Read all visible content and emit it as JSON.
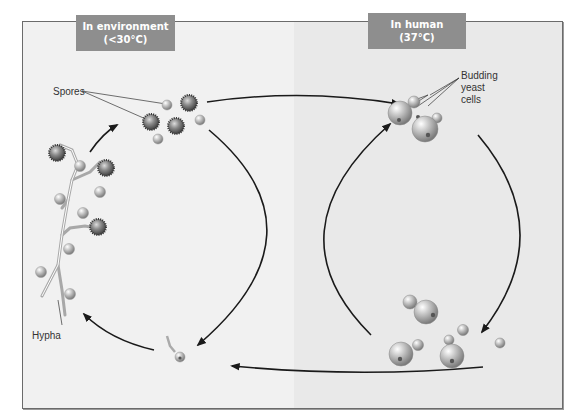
{
  "diagram": {
    "stages": {
      "environment": {
        "line1": "In environment",
        "line2": "(<30°C)"
      },
      "human": {
        "line1": "In human",
        "line2": "(37°C)"
      }
    },
    "labels": {
      "spores": "Spores",
      "budding_line1": "Budding",
      "budding_line2": "yeast",
      "budding_line3": "cells",
      "hypha": "Hypha"
    },
    "colors": {
      "stage_box": "#8e8e8e",
      "panel_left": "#f1f1f1",
      "panel_right": "#e9e9e9",
      "arrow": "#1a1a1a"
    },
    "flow": [
      "Spores -> Budding yeast cells",
      "Budding yeast cells -> Budding yeast cells (multiplying)",
      "Budding yeast cells -> Germinating spore",
      "Germinating spore -> Hypha",
      "Hypha -> Spores"
    ]
  }
}
